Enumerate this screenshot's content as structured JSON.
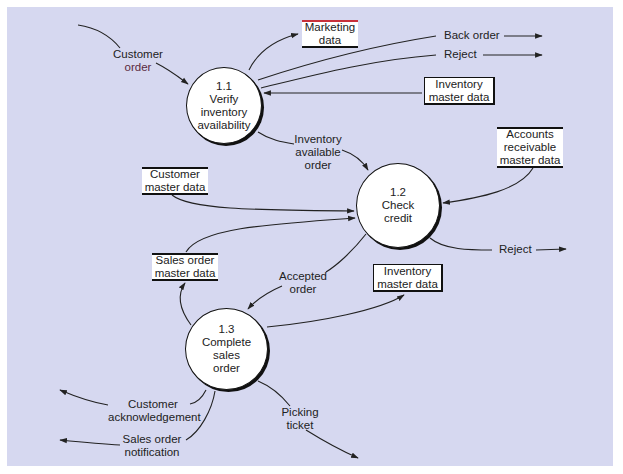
{
  "diagram": {
    "type": "data-flow-diagram",
    "colors": {
      "background": "#d6d8f0",
      "line": "#222222",
      "node_fill": "#ffffff"
    },
    "processes": [
      {
        "id": "1.1",
        "number": "1.1",
        "name_lines": [
          "Verify",
          "inventory",
          "availability"
        ]
      },
      {
        "id": "1.2",
        "number": "1.2",
        "name_lines": [
          "Check",
          "credit"
        ]
      },
      {
        "id": "1.3",
        "number": "1.3",
        "name_lines": [
          "Complete",
          "sales",
          "order"
        ]
      }
    ],
    "data_stores": [
      {
        "id": "marketing",
        "lines": [
          "Marketing",
          "data"
        ]
      },
      {
        "id": "inventory-top",
        "lines": [
          "Inventory",
          "master data"
        ]
      },
      {
        "id": "accounts-receivable",
        "lines": [
          "Accounts",
          "receivable",
          "master data"
        ]
      },
      {
        "id": "customer-master",
        "lines": [
          "Customer",
          "master data"
        ]
      },
      {
        "id": "sales-order-master",
        "lines": [
          "Sales order",
          "master data"
        ]
      },
      {
        "id": "inventory-bottom",
        "lines": [
          "Inventory",
          "master data"
        ]
      }
    ],
    "flow_labels": {
      "customer_order": [
        "Customer",
        "order"
      ],
      "back_order": "Back order",
      "reject_top": "Reject",
      "inventory_available_order": [
        "Inventory",
        "available",
        "order"
      ],
      "reject_credit": "Reject",
      "accepted_order": [
        "Accepted",
        "order"
      ],
      "customer_acknowledgement": [
        "Customer",
        "acknowledgement"
      ],
      "sales_order_notification": [
        "Sales order",
        "notification"
      ],
      "picking_ticket": [
        "Picking",
        "ticket"
      ]
    },
    "flows": [
      {
        "from": "external",
        "to": "1.1",
        "label": "Customer order"
      },
      {
        "from": "1.1",
        "to": "marketing",
        "label": ""
      },
      {
        "from": "1.1",
        "to": "external",
        "label": "Back order"
      },
      {
        "from": "1.1",
        "to": "external",
        "label": "Reject"
      },
      {
        "from": "inventory-top",
        "to": "1.1",
        "label": ""
      },
      {
        "from": "1.1",
        "to": "1.2",
        "label": "Inventory available order"
      },
      {
        "from": "accounts-receivable",
        "to": "1.2",
        "label": ""
      },
      {
        "from": "customer-master",
        "to": "1.2",
        "label": ""
      },
      {
        "from": "sales-order-master",
        "to": "1.2",
        "label": ""
      },
      {
        "from": "1.2",
        "to": "external",
        "label": "Reject"
      },
      {
        "from": "1.2",
        "to": "1.3",
        "label": "Accepted order"
      },
      {
        "from": "1.3",
        "to": "sales-order-master",
        "label": ""
      },
      {
        "from": "1.3",
        "to": "inventory-bottom",
        "label": ""
      },
      {
        "from": "1.3",
        "to": "external",
        "label": "Customer acknowledgement"
      },
      {
        "from": "1.3",
        "to": "external",
        "label": "Sales order notification"
      },
      {
        "from": "1.3",
        "to": "external",
        "label": "Picking ticket"
      }
    ]
  }
}
